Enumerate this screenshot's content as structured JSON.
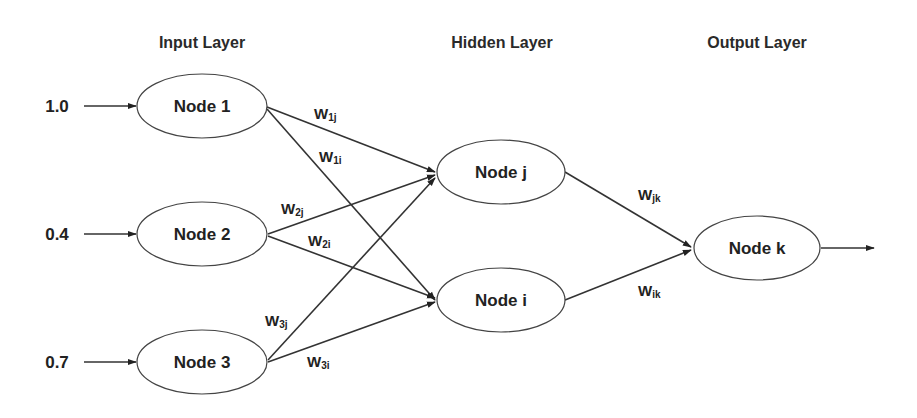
{
  "diagram": {
    "type": "neural-network",
    "layers": {
      "input": {
        "title": "Input Layer"
      },
      "hidden": {
        "title": "Hidden Layer"
      },
      "output": {
        "title": "Output Layer"
      }
    },
    "inputs": [
      {
        "value": "1.0",
        "node": "Node 1"
      },
      {
        "value": "0.4",
        "node": "Node 2"
      },
      {
        "value": "0.7",
        "node": "Node 3"
      }
    ],
    "nodes": {
      "node1": "Node 1",
      "node2": "Node 2",
      "node3": "Node 3",
      "nodej": "Node j",
      "nodei": "Node i",
      "nodek": "Node k"
    },
    "weights": {
      "w1j": {
        "base": "W",
        "sub": "1j"
      },
      "w1i": {
        "base": "W",
        "sub": "1i"
      },
      "w2j": {
        "base": "W",
        "sub": "2j"
      },
      "w2i": {
        "base": "W",
        "sub": "2i"
      },
      "w3j": {
        "base": "W",
        "sub": "3j"
      },
      "w3i": {
        "base": "W",
        "sub": "3i"
      },
      "wjk": {
        "base": "W",
        "sub": "jk"
      },
      "wik": {
        "base": "W",
        "sub": "ik"
      }
    },
    "colors": {
      "stroke": "#333333",
      "text": "#222222",
      "background": "#ffffff"
    }
  }
}
